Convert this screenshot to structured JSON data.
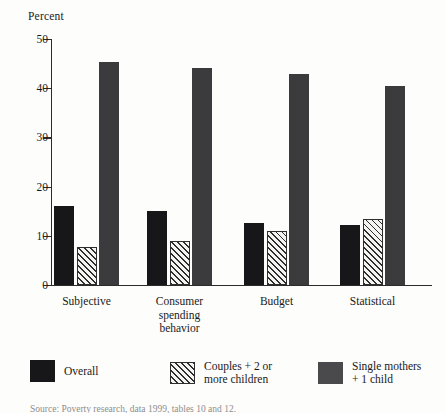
{
  "chart_data": {
    "type": "bar",
    "title": "",
    "xlabel": "",
    "ylabel": "Percent",
    "ylim": [
      0,
      50
    ],
    "yticks": [
      0,
      10,
      20,
      30,
      40,
      50
    ],
    "grid": false,
    "legend_position": "bottom",
    "categories": [
      "Subjective",
      "Consumer\nspending\nbehavior",
      "Budget",
      "Statistical"
    ],
    "category_labels": [
      "Subjective",
      "Consumer spending behavior",
      "Budget",
      "Statistical"
    ],
    "series": [
      {
        "name": "Overall",
        "color": "#17171a",
        "pattern": "solid",
        "values": [
          16.0,
          15.0,
          12.7,
          12.2
        ]
      },
      {
        "name": "Couples + 2 or more children",
        "color": "#2e2e2e",
        "pattern": "diagonal-hatch",
        "values": [
          7.8,
          8.9,
          10.9,
          13.4
        ]
      },
      {
        "name": "Single mothers + 1 child",
        "color": "#3b3b3d",
        "pattern": "solid",
        "values": [
          45.3,
          44.2,
          42.9,
          40.5
        ]
      }
    ]
  },
  "axis": {
    "y_title": "Percent",
    "tick_labels": [
      "50",
      "40",
      "30",
      "20",
      "10",
      "0"
    ]
  },
  "legend": {
    "items": [
      {
        "label": "Overall",
        "swatch": "overall"
      },
      {
        "label": "Couples + 2 or\nmore children",
        "swatch": "couples"
      },
      {
        "label": "Single mothers\n+ 1 child",
        "swatch": "single"
      }
    ]
  },
  "footer": {
    "source_text": "Source: Poverty research, data 1999, tables 10 and 12."
  }
}
